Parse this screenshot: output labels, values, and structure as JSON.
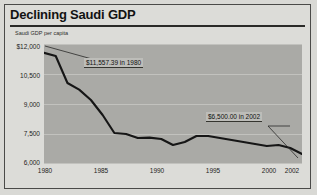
{
  "figure": {
    "title": "Declining Saudi GDP",
    "background_color": "#d9d9d5",
    "plot_background_color": "#aaaaa6",
    "line_color": "#1a1a1a",
    "grid_color": "#c2c2be"
  },
  "chart_data": {
    "type": "line",
    "title": "Declining Saudi GDP",
    "xlabel": "",
    "ylabel": "Saudi GDP per capita",
    "xlim": [
      1980,
      2002
    ],
    "ylim": [
      6000,
      12000
    ],
    "grid": true,
    "legend": "none",
    "y_ticks": [
      "$12,000",
      "10,500",
      "9,000",
      "7,500",
      "6,000"
    ],
    "y_tick_values": [
      12000,
      10500,
      9000,
      7500,
      6000
    ],
    "x_ticks": [
      "1980",
      "1985",
      "1990",
      "1995",
      "2000",
      "2002"
    ],
    "x_tick_values": [
      1980,
      1985,
      1990,
      1995,
      2000,
      2002
    ],
    "x": [
      1980,
      1981,
      1982,
      1983,
      1984,
      1985,
      1986,
      1987,
      1988,
      1989,
      1990,
      1991,
      1992,
      1993,
      1994,
      1995,
      1996,
      1997,
      1998,
      1999,
      2000,
      2001,
      2002
    ],
    "values": [
      11557.39,
      11400,
      10050,
      9720,
      9200,
      8450,
      7550,
      7500,
      7300,
      7320,
      7250,
      6950,
      7100,
      7400,
      7400,
      7300,
      7200,
      7100,
      7000,
      6900,
      6950,
      6800,
      6500
    ],
    "series": [
      {
        "name": "Saudi GDP per capita",
        "values": [
          11557.39,
          11400,
          10050,
          9720,
          9200,
          8450,
          7550,
          7500,
          7300,
          7320,
          7250,
          6950,
          7100,
          7400,
          7400,
          7300,
          7200,
          7100,
          7000,
          6900,
          6950,
          6800,
          6500
        ]
      }
    ],
    "annotations": [
      {
        "id": "start-value",
        "label": "$11,557.39 in 1980",
        "point_x": 1980,
        "point_y": 11557.39
      },
      {
        "id": "end-value",
        "label": "$6,500.00 in 2002",
        "point_x": 2002,
        "point_y": 6500.0
      }
    ]
  }
}
